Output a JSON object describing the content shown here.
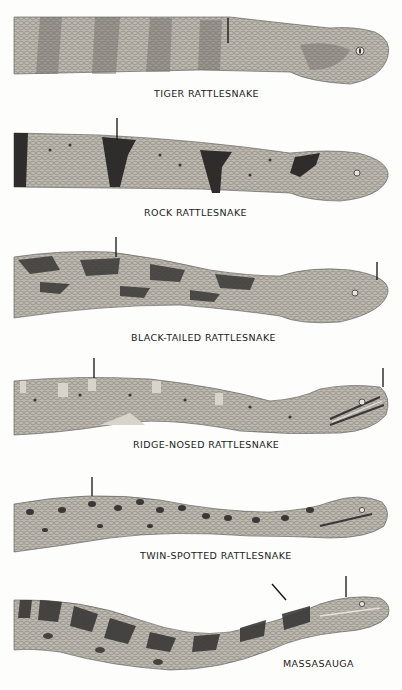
{
  "plate": {
    "species": [
      {
        "name": "TIGER RATTLESNAKE",
        "pattern": "faint-bands",
        "pointers": 1
      },
      {
        "name": "ROCK RATTLESNAKE",
        "pattern": "dark-crossbands",
        "pointers": 1
      },
      {
        "name": "BLACK-TAILED RATTLESNAKE",
        "pattern": "dark-blotches",
        "pointers": 2
      },
      {
        "name": "RIDGE-NOSED RATTLESNAKE",
        "pattern": "pale-crossbars-facial-stripes",
        "pointers": 2
      },
      {
        "name": "TWIN-SPOTTED RATTLESNAKE",
        "pattern": "paired-spots",
        "pointers": 1
      },
      {
        "name": "MASSASAUGA",
        "pattern": "large-blotches",
        "pointers": 2
      }
    ]
  },
  "colors": {
    "background": "#fdfdfb",
    "body": "#b9b6ae",
    "dark": "#3a3836",
    "mid": "#8f8b84",
    "text": "#222222"
  }
}
